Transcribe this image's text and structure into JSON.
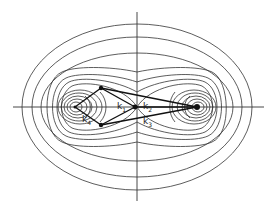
{
  "diagram": {
    "labels": [
      {
        "id": "k1",
        "text": "k",
        "sub": "1"
      },
      {
        "id": "k2",
        "text": "k",
        "sub": "2"
      },
      {
        "id": "k3",
        "text": "k",
        "sub": "3"
      },
      {
        "id": "k4",
        "text": "k",
        "sub": "4"
      }
    ],
    "colors": {
      "line": "#222222",
      "background": "#ffffff"
    }
  }
}
